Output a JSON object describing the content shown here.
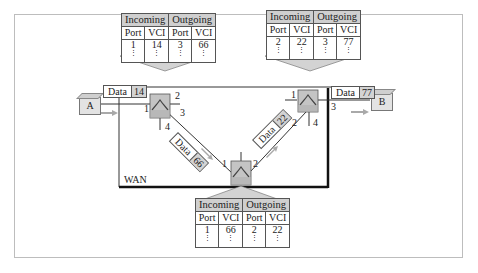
{
  "diagram": {
    "wan_label": "WAN",
    "hosts": [
      {
        "id": "A",
        "label": "A"
      },
      {
        "id": "B",
        "label": "B"
      }
    ],
    "frames": [
      {
        "id": "frame-a",
        "word": "Data",
        "vci": "14"
      },
      {
        "id": "frame-s1-s2",
        "word": "Data",
        "vci": "66"
      },
      {
        "id": "frame-s2-s3",
        "word": "Data",
        "vci": "22"
      },
      {
        "id": "frame-b",
        "word": "Data",
        "vci": "77"
      }
    ],
    "switches": [
      {
        "id": "switch-1",
        "ports": {
          "p1": "1",
          "p2": "2",
          "p3": "3",
          "p4": "4"
        }
      },
      {
        "id": "switch-2",
        "ports": {
          "p1": "1",
          "p2": "2"
        }
      },
      {
        "id": "switch-3",
        "ports": {
          "p1": "1",
          "p2": "2",
          "p3": "3",
          "p4": "4"
        }
      }
    ],
    "tables": [
      {
        "switch": "switch-1",
        "group_headers": [
          "Incoming",
          "Outgoing"
        ],
        "columns": [
          "Port",
          "VCI",
          "Port",
          "VCI"
        ],
        "rows": [
          [
            "1",
            "14",
            "3",
            "66"
          ]
        ]
      },
      {
        "switch": "switch-3",
        "group_headers": [
          "Incoming",
          "Outgoing"
        ],
        "columns": [
          "Port",
          "VCI",
          "Port",
          "VCI"
        ],
        "rows": [
          [
            "2",
            "22",
            "3",
            "77"
          ]
        ]
      },
      {
        "switch": "switch-2",
        "group_headers": [
          "Incoming",
          "Outgoing"
        ],
        "columns": [
          "Port",
          "VCI",
          "Port",
          "VCI"
        ],
        "rows": [
          [
            "1",
            "66",
            "2",
            "22"
          ]
        ]
      }
    ],
    "dots": "⋮",
    "colors": {
      "switch_fill": "#c4c4c4",
      "table_header": "#cfcfcf",
      "arrow": "#a9a9a9",
      "wan_border": "#111111"
    }
  }
}
